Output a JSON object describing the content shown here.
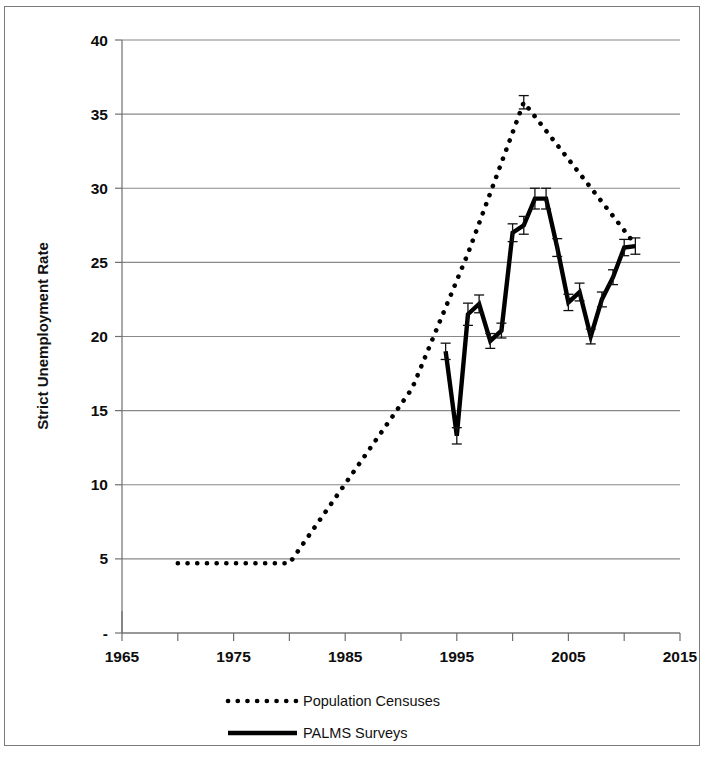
{
  "chart_data": {
    "type": "line",
    "title": "",
    "xlabel": "",
    "ylabel": "Strict Unemployment Rate",
    "xlim": [
      1965,
      2015
    ],
    "ylim": [
      0,
      40
    ],
    "xticks": [
      1965,
      1975,
      1985,
      1995,
      2005,
      2015
    ],
    "xtick_labels": [
      "1965",
      "1975",
      "1985",
      "1995",
      "2005",
      "2015"
    ],
    "xminor_step": 5,
    "yticks": [
      0,
      5,
      10,
      15,
      20,
      25,
      30,
      35,
      40
    ],
    "ytick_labels": [
      "-",
      "5",
      "10",
      "15",
      "20",
      "25",
      "30",
      "35",
      "40"
    ],
    "grid": "horizontal",
    "legend_position": "bottom-center",
    "series": [
      {
        "name": "Population Censuses",
        "style": "dotted",
        "color": "#000000",
        "x": [
          1970,
          1980,
          1991,
          1996,
          2001,
          2011
        ],
        "values": [
          4.7,
          4.7,
          16.5,
          25.6,
          35.8,
          26.2
        ],
        "error_bars": [
          0,
          0,
          0,
          0,
          0.45,
          0
        ]
      },
      {
        "name": "PALMS Surveys",
        "style": "solid",
        "color": "#000000",
        "x": [
          1994,
          1995,
          1996,
          1997,
          1998,
          1999,
          2000,
          2001,
          2002,
          2003,
          2004,
          2005,
          2006,
          2007,
          2008,
          2009,
          2010,
          2011
        ],
        "values": [
          19.0,
          13.3,
          21.5,
          22.2,
          19.7,
          20.4,
          27.0,
          27.5,
          29.3,
          29.3,
          26.0,
          22.3,
          23.0,
          20.0,
          22.5,
          24.0,
          26.0,
          26.1
        ],
        "error_bars": [
          0.55,
          0.55,
          0.75,
          0.6,
          0.5,
          0.5,
          0.6,
          0.6,
          0.7,
          0.7,
          0.6,
          0.55,
          0.6,
          0.5,
          0.5,
          0.5,
          0.55,
          0.55
        ]
      }
    ],
    "legend": [
      {
        "label": "Population Censuses",
        "style": "dotted"
      },
      {
        "label": "PALMS Surveys",
        "style": "solid"
      }
    ]
  }
}
